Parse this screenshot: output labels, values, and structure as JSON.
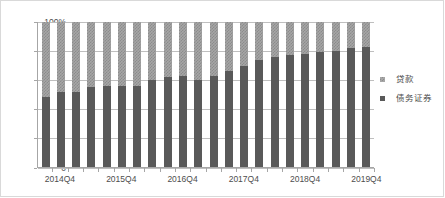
{
  "chart_data": {
    "type": "bar",
    "stacked": true,
    "stack_mode": "percent",
    "title": "",
    "xlabel": "",
    "ylabel": "",
    "ylim": [
      0,
      100
    ],
    "ytick_labels": [
      "0",
      "20%",
      "40%",
      "60%",
      "80%",
      "100%"
    ],
    "ytick_values": [
      0,
      20,
      40,
      60,
      80,
      100
    ],
    "grid": true,
    "legend_position": "right",
    "categories": [
      "2014Q3",
      "2014Q4",
      "2015Q1",
      "2015Q2",
      "2015Q3",
      "2015Q4",
      "2016Q1",
      "2016Q2",
      "2016Q3",
      "2016Q4",
      "2017Q1",
      "2017Q2",
      "2017Q3",
      "2017Q4",
      "2018Q1",
      "2018Q2",
      "2018Q3",
      "2018Q4",
      "2019Q1",
      "2019Q2",
      "2019Q3",
      "2019Q4"
    ],
    "visible_xtick_labels": [
      "2014Q4",
      "2015Q4",
      "2016Q4",
      "2017Q4",
      "2018Q4",
      "2019Q4"
    ],
    "visible_xtick_indices": [
      1,
      5,
      9,
      13,
      17,
      21
    ],
    "series": [
      {
        "name": "债务证券",
        "color": "#595959",
        "pattern": "solid",
        "values": [
          48,
          52,
          52,
          55,
          56,
          56,
          56,
          60,
          62,
          63,
          60,
          63,
          66,
          70,
          74,
          76,
          77,
          78,
          79,
          80,
          82,
          82.5
        ]
      },
      {
        "name": "贷款",
        "color": "#a6a6a6",
        "pattern": "checkered",
        "values": [
          52,
          48,
          48,
          45,
          44,
          44,
          44,
          40,
          38,
          37,
          40,
          37,
          34,
          30,
          26,
          24,
          23,
          22,
          21,
          20,
          18,
          17.5
        ]
      }
    ]
  },
  "legend": {
    "items": [
      {
        "label": "贷款",
        "key": "loans"
      },
      {
        "label": "债务证券",
        "key": "debt"
      }
    ]
  }
}
